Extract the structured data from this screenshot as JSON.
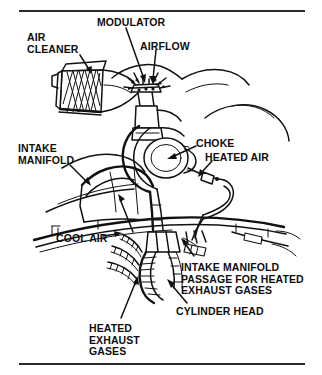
{
  "figure": {
    "ink_color": "#111111",
    "background_color": "#ffffff",
    "rule_color": "#2b2b2b"
  },
  "rules": {
    "top_label": "top-divider-rule",
    "bottom_label": "bottom-divider-rule"
  },
  "callouts": [
    {
      "id": "air-cleaner",
      "text": "AIR\nCLEANER",
      "x": 27,
      "y": 32,
      "align": "left"
    },
    {
      "id": "modulator",
      "text": "MODULATOR",
      "x": 97,
      "y": 17,
      "align": "left"
    },
    {
      "id": "airflow",
      "text": "AIRFLOW",
      "x": 140,
      "y": 41,
      "align": "left"
    },
    {
      "id": "intake-manifold",
      "text": "INTAKE\nMANIFOLD",
      "x": 18,
      "y": 143,
      "align": "left"
    },
    {
      "id": "choke",
      "text": "CHOKE",
      "x": 196,
      "y": 138,
      "align": "left"
    },
    {
      "id": "heated-air",
      "text": "HEATED AIR",
      "x": 205,
      "y": 152,
      "align": "left"
    },
    {
      "id": "cool-air",
      "text": "COOL AIR",
      "x": 56,
      "y": 233,
      "align": "left"
    },
    {
      "id": "intake-manifold-passage",
      "text": "INTAKE MANIFOLD\nPASSAGE FOR HEATED\nEXHAUST GASES",
      "x": 181,
      "y": 262,
      "align": "left"
    },
    {
      "id": "cylinder-head",
      "text": "CYLINDER HEAD",
      "x": 176,
      "y": 306,
      "align": "left"
    },
    {
      "id": "heated-exhaust-gases",
      "text": "HEATED\nEXHAUST\nGASES",
      "x": 89,
      "y": 323,
      "align": "left"
    }
  ],
  "components": [
    {
      "id": "air-cleaner-housing",
      "name": "air-cleaner-housing"
    },
    {
      "id": "air-cleaner-filter-mesh",
      "name": "filter-mesh-element"
    },
    {
      "id": "snorkel-tube",
      "name": "air-cleaner-snorkel-tube"
    },
    {
      "id": "modulator-valve",
      "name": "vacuum-modulator-valve"
    },
    {
      "id": "airflow-arrows",
      "name": "airflow-arrows"
    },
    {
      "id": "carburetor-body",
      "name": "carburetor-body"
    },
    {
      "id": "choke-housing",
      "name": "choke-housing"
    },
    {
      "id": "heated-air-tube",
      "name": "heated-air-tube"
    },
    {
      "id": "intake-manifold-body",
      "name": "intake-manifold-body"
    },
    {
      "id": "cylinder-head-body",
      "name": "cylinder-head-body"
    },
    {
      "id": "exhaust-manifold-passage",
      "name": "exhaust-manifold-passage"
    },
    {
      "id": "exhaust-gas-flow",
      "name": "exhaust-gas-flow-ribbons"
    },
    {
      "id": "engine-block-contour",
      "name": "engine-block-contour"
    }
  ]
}
